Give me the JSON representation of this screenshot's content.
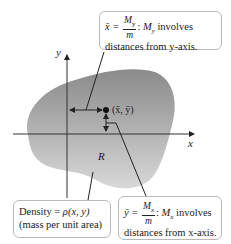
{
  "diagram": {
    "axes": {
      "x_label": "x",
      "y_label": "y"
    },
    "region_label": "R",
    "centroid_label": "(x̄, ȳ)",
    "colors": {
      "region_top": "#8c8c8c",
      "region_bottom": "#d4d4d4",
      "axis": "#333333",
      "box_border": "#b9b9b9"
    }
  },
  "callouts": {
    "top": {
      "lhs": "x̄ =",
      "num": "M",
      "num_sub": "y",
      "den": "m",
      "rest_var": "M",
      "rest_sub": "y",
      "rest_text": " involves",
      "line2": "distances from y-axis."
    },
    "density": {
      "line1_prefix": "Density = ",
      "line1_expr": "ρ(x, y)",
      "line2": "(mass per unit area)"
    },
    "bottom": {
      "lhs": "ȳ =",
      "num": "M",
      "num_sub": "x",
      "den": "m",
      "rest_var": "M",
      "rest_sub": "x",
      "rest_text": " involves",
      "line2": "distances from x-axis."
    }
  }
}
